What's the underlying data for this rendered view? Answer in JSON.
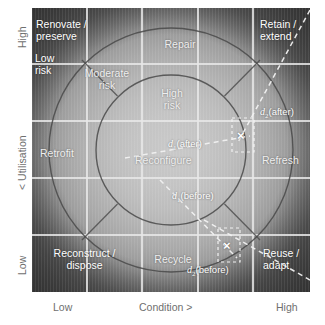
{
  "figure": {
    "type": "matrix-diagram",
    "grid": {
      "cols": 5,
      "rows": 5
    }
  },
  "axes": {
    "x": {
      "low": "Low",
      "title": "Condition >",
      "high": "High"
    },
    "y": {
      "high": "High",
      "title": "< Utilisation",
      "low": "Low"
    }
  },
  "strategies": {
    "renovate_preserve": "Renovate /\npreserve",
    "repair": "Repair",
    "retain_extend": "Retain /\nextend",
    "retrofit": "Retrofit",
    "reconfigure": "Reconfigure",
    "refresh": "Refresh",
    "reconstruct_dispose": "Reconstruct /\ndispose",
    "recycle": "Recycle",
    "reuse_adapt": "Reuse /\nadapt"
  },
  "risk_bands": {
    "low": "Low\nrisk",
    "moderate": "Moderate\nrisk",
    "high": "High\nrisk"
  },
  "vectors": [
    {
      "id": "d1_after",
      "label_d": "d",
      "label_sub": "1",
      "label_rm": "(after)"
    },
    {
      "id": "d2_after",
      "label_d": "d",
      "label_sub": "2",
      "label_rm": "(after)"
    },
    {
      "id": "d1_before",
      "label_d": "d",
      "label_sub": "1",
      "label_rm": "(before)"
    },
    {
      "id": "d2_before",
      "label_d": "d",
      "label_sub": "2",
      "label_rm": "(before)"
    }
  ],
  "markers": [
    {
      "id": "marker-after",
      "glyph": "×"
    },
    {
      "id": "marker-before",
      "glyph": "×"
    }
  ],
  "colors": {
    "plot_light": "#c9c9c9",
    "plot_mid": "#9d9d9d",
    "plot_dark": "#565656",
    "gridline": "#e7e7e7",
    "arc": "#4a4a4a",
    "dashed": "#f2f2f2",
    "axis_text": "#6f6f6f",
    "label_text": "#ffffff"
  }
}
